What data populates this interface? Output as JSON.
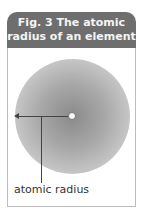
{
  "figure": {
    "title_line1": "Fig. 3  The atomic",
    "title_line2": "radius of an element",
    "label": "atomic radius",
    "header_color": "#6e6e6e",
    "atom_color": "#9a9a9a"
  }
}
